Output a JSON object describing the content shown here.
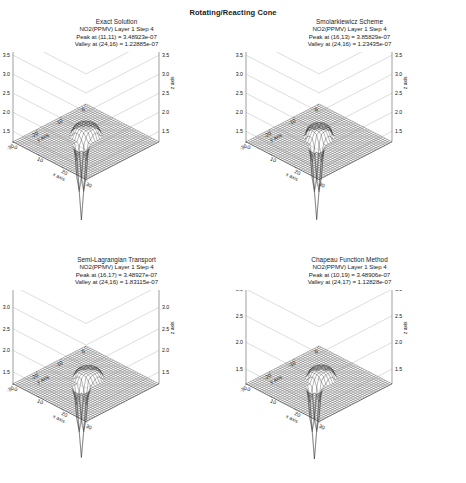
{
  "figure": {
    "title": "Rotating/Reacting Cone"
  },
  "panels": [
    {
      "key": "exact-solution",
      "title": "Exact Solution",
      "subtitle": "NO2(PPMV)  Layer 1  Step 4",
      "peak": "Peak at (11,11) = 3.48923e-07",
      "valley": "Valley at (24,16) = 1.22885e-07",
      "z_exponent": "(x10  )",
      "z_exponent_sup": "-7",
      "z_ticks": [
        "4.0",
        "3.5",
        "3.0",
        "2.5",
        "2.0",
        "1.5"
      ],
      "x_label": "x axis",
      "y_label": "y axis",
      "z_label": "z axis",
      "x_ticks": [
        "0",
        "10",
        "20",
        "30"
      ],
      "y_ticks": [
        "-30",
        "-20",
        "-10",
        "0"
      ]
    },
    {
      "key": "smolarkiewicz-scheme",
      "title": "Smolarkiewicz Scheme",
      "subtitle": "NO2(PPMV)  Layer 1  Step 4",
      "peak": "Peak at (16,13) = 3.85829e-07",
      "valley": "Valley at (24,16) = 1.23435e-07",
      "z_exponent": "(x10  )",
      "z_exponent_sup": "-7",
      "z_ticks": [
        "4.0",
        "3.5",
        "3.0",
        "2.5",
        "2.0",
        "1.5"
      ],
      "x_label": "x axis",
      "y_label": "y axis",
      "z_label": "z axis",
      "x_ticks": [
        "0",
        "10",
        "20",
        "30"
      ],
      "y_ticks": [
        "-30",
        "-20",
        "-10",
        "0"
      ]
    },
    {
      "key": "semi-lagrangian-transport",
      "title": "Semi-Lagrangian Transport",
      "subtitle": "NO2(PPMV)  Layer 1  Step 4",
      "peak": "Peak at (16,17) = 3.48927e-07",
      "valley": "Valley at (24,16) = 1.83115e-07",
      "z_exponent": "(x10  )",
      "z_exponent_sup": "-7",
      "z_ticks": [
        "3.5",
        "3.0",
        "2.5",
        "2.0",
        "1.5"
      ],
      "x_label": "x axis",
      "y_label": "y axis",
      "z_label": "z axis",
      "x_ticks": [
        "0",
        "10",
        "20",
        "30"
      ],
      "y_ticks": [
        "-30",
        "-20",
        "-10",
        "0"
      ]
    },
    {
      "key": "chapeau-function-method",
      "title": "Chapeau Function Method",
      "subtitle": "NO2(PPMV)  Layer 1  Step 4",
      "peak": "Peak at (10,19) = 3.48906e-07",
      "valley": "Valley at (24,17) = 1.12828e-07",
      "z_exponent": "(x10  )",
      "z_exponent_sup": "-7",
      "z_ticks": [
        "3.0",
        "2.5",
        "2.0",
        "1.5"
      ],
      "x_label": "x axis",
      "y_label": "y axis",
      "z_label": "z axis",
      "x_ticks": [
        "0",
        "10",
        "20",
        "30"
      ],
      "y_ticks": [
        "-30",
        "-20",
        "-10",
        "0"
      ]
    }
  ],
  "chart_data": {
    "type": "surface",
    "title": "Rotating/Reacting Cone",
    "xlabel": "x axis",
    "ylabel": "y axis",
    "zlabel": "z axis",
    "xlim": [
      -30,
      30
    ],
    "ylim": [
      -30,
      30
    ],
    "z_scale": "1e-07",
    "grid": true,
    "legend": "none",
    "panels": [
      {
        "name": "Exact Solution",
        "variable": "NO2(PPMV)",
        "layer": 1,
        "step": 4,
        "peak_position": [
          11,
          11
        ],
        "peak_value": 3.48923e-07,
        "valley_position": [
          24,
          16
        ],
        "valley_value": 1.22885e-07,
        "zlim": [
          1.5e-07,
          4e-07
        ],
        "z_ticks": [
          1.5,
          2.0,
          2.5,
          3.0,
          3.5,
          4.0
        ]
      },
      {
        "name": "Smolarkiewicz Scheme",
        "variable": "NO2(PPMV)",
        "layer": 1,
        "step": 4,
        "peak_position": [
          16,
          13
        ],
        "peak_value": 3.85829e-07,
        "valley_position": [
          24,
          16
        ],
        "valley_value": 1.23435e-07,
        "zlim": [
          1.5e-07,
          4e-07
        ],
        "z_ticks": [
          1.5,
          2.0,
          2.5,
          3.0,
          3.5,
          4.0
        ]
      },
      {
        "name": "Semi-Lagrangian Transport",
        "variable": "NO2(PPMV)",
        "layer": 1,
        "step": 4,
        "peak_position": [
          16,
          17
        ],
        "peak_value": 3.48927e-07,
        "valley_position": [
          24,
          16
        ],
        "valley_value": 1.83115e-07,
        "zlim": [
          1.5e-07,
          3.5e-07
        ],
        "z_ticks": [
          1.5,
          2.0,
          2.5,
          3.0,
          3.5
        ]
      },
      {
        "name": "Chapeau Function Method",
        "variable": "NO2(PPMV)",
        "layer": 1,
        "step": 4,
        "peak_position": [
          10,
          19
        ],
        "peak_value": 3.48906e-07,
        "valley_position": [
          24,
          17
        ],
        "valley_value": 1.12828e-07,
        "zlim": [
          1.5e-07,
          3e-07
        ],
        "z_ticks": [
          1.5,
          2.0,
          2.5,
          3.0
        ]
      }
    ]
  }
}
